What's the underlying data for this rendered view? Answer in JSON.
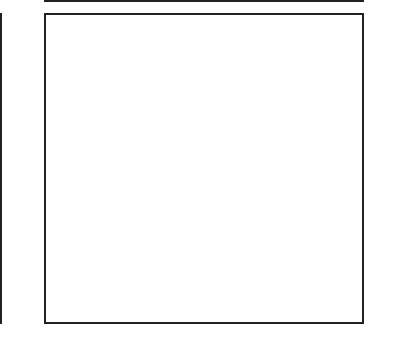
{
  "grid": {
    "columns": 15,
    "rows": 15,
    "fill_color": "#6a6a6a",
    "heavy_vertical_after_column": 10,
    "heavy_horizontal_after_row_from_top": 5,
    "rows_by_label": [
      {
        "row": 15,
        "filled": []
      },
      {
        "row": 14,
        "filled": [
          5,
          6,
          8,
          9
        ]
      },
      {
        "row": 13,
        "filled": [
          1,
          2,
          5,
          6,
          7,
          8,
          9,
          12,
          13
        ]
      },
      {
        "row": 12,
        "filled": [
          1,
          4,
          7,
          10,
          13
        ]
      },
      {
        "row": 11,
        "filled": [
          7
        ]
      },
      {
        "row": 10,
        "filled": [
          5,
          9
        ]
      },
      {
        "row": 9,
        "filled": [
          4,
          5,
          9,
          10
        ]
      },
      {
        "row": 8,
        "filled": [
          1,
          2,
          3,
          4,
          5,
          9,
          10,
          11,
          12,
          13
        ]
      },
      {
        "row": 7,
        "filled": [
          1,
          3,
          4,
          5,
          9,
          10,
          11,
          13
        ]
      },
      {
        "row": 6,
        "filled": [
          1,
          3,
          5,
          6,
          8,
          9,
          13
        ]
      },
      {
        "row": 5,
        "filled": [
          5,
          6,
          7,
          8,
          9
        ]
      },
      {
        "row": 4,
        "filled": [
          5,
          6,
          7,
          8,
          9
        ]
      },
      {
        "row": 3,
        "filled": [
          1,
          6,
          7,
          8,
          13
        ]
      },
      {
        "row": 2,
        "filled": [
          7
        ]
      },
      {
        "row": 1,
        "filled": []
      }
    ]
  },
  "labels": {
    "left": [
      "14",
      "12",
      "10",
      "8",
      "6",
      "4",
      "2"
    ],
    "right": [
      "15",
      "13",
      "11",
      "9",
      "7",
      "5",
      "3",
      "1"
    ]
  }
}
